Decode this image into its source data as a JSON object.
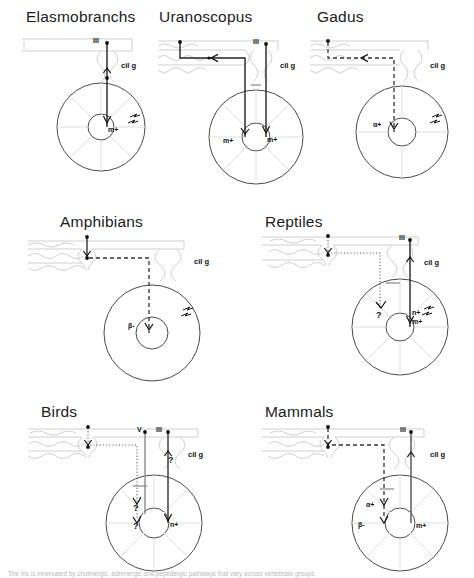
{
  "figure": {
    "title_note": "Comparative iris innervation pathways across vertebrate groups",
    "caption": "The iris is innervated by cholinergic, adrenergic and peptidergic pathways that vary across vertebrate groups."
  },
  "labels": {
    "cil_g": "cil g",
    "nerve_iii": "III",
    "nerve_v": "V",
    "muscarinic": "m+",
    "nicotinic": "n+",
    "alpha_plus": "α+",
    "beta_minus": "β-",
    "unknown": "?"
  },
  "panels": [
    {
      "id": "elasmobranchs",
      "title": "Elasmobranchs",
      "nerves": [
        "III"
      ],
      "ganglion": "cil g",
      "receptors": [
        "m+"
      ],
      "has_light_symbol": true,
      "pathway_style": "solid",
      "notes": "Direct oculomotor (III) cholinergic input through ciliary ganglion to iris, muscarinic excitatory."
    },
    {
      "id": "uranoscopus",
      "title": "Uranoscopus",
      "nerves": [
        "III"
      ],
      "ganglion": "cil g",
      "receptors": [
        "m+",
        "m+"
      ],
      "has_light_symbol": false,
      "pathway_style": "solid",
      "notes": "Two solid cholinergic routes, both with muscarinic excitatory endings."
    },
    {
      "id": "gadus",
      "title": "Gadus",
      "nerves": [],
      "ganglion": "cil g",
      "receptors": [
        "α+"
      ],
      "has_light_symbol": true,
      "pathway_style": "dashed",
      "notes": "Dashed adrenergic sympathetic pathway with alpha excitatory receptors."
    },
    {
      "id": "amphibians",
      "title": "Amphibians",
      "nerves": [],
      "ganglion": "cil g",
      "receptors": [
        "β-"
      ],
      "has_light_symbol": true,
      "pathway_style": "dashed",
      "notes": "Dashed adrenergic pathway with beta inhibitory receptors."
    },
    {
      "id": "reptiles",
      "title": "Reptiles",
      "nerves": [
        "III"
      ],
      "ganglion": "cil g",
      "receptors": [
        "n+",
        "m+"
      ],
      "unknown_marks": 1,
      "has_light_symbol": true,
      "pathway_style": "dotted+solid",
      "notes": "Solid III cholinergic route with nicotinic and muscarinic excitation; dotted route of unknown transmitter."
    },
    {
      "id": "birds",
      "title": "Birds",
      "nerves": [
        "V",
        "III"
      ],
      "ganglion": "cil g",
      "receptors": [
        "n+"
      ],
      "unknown_marks": 3,
      "has_light_symbol": false,
      "pathway_style": "dotted+solid",
      "notes": "Trigeminal (V) and oculomotor (III) inputs, nicotinic excitation, several unknown transmitters."
    },
    {
      "id": "mammals",
      "title": "Mammals",
      "nerves": [
        "III"
      ],
      "ganglion": "cil g",
      "receptors": [
        "α+",
        "β-",
        "m+"
      ],
      "has_light_symbol": false,
      "pathway_style": "dashed+solid",
      "notes": "Solid cholinergic III route with muscarinic excitation plus dashed adrenergic route with alpha excitatory and beta inhibitory receptors."
    }
  ],
  "colors": {
    "ink": "#1a1a1a",
    "line": "#3a3a3a",
    "faint": "#cfcfcf",
    "iris_spoke": "#dedede",
    "background": "#ffffff"
  }
}
